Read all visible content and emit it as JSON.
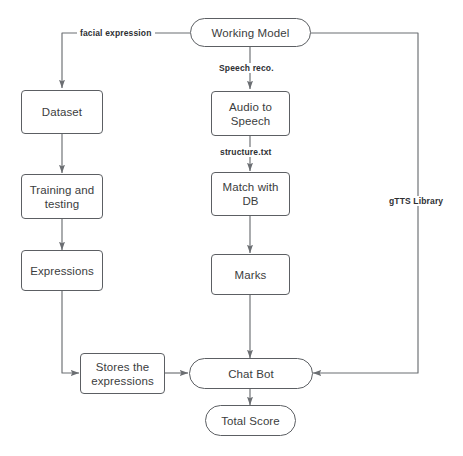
{
  "diagram": {
    "background_color": "#ffffff",
    "stroke_color": "#5c5f63",
    "text_color": "#3b3d40",
    "nodes": [
      {
        "id": "working-model",
        "label": "Working Model",
        "shape": "stadium"
      },
      {
        "id": "dataset",
        "label": "Dataset",
        "shape": "box"
      },
      {
        "id": "training-and-testing",
        "label": "Training and\ntesting",
        "shape": "box"
      },
      {
        "id": "expressions",
        "label": "Expressions",
        "shape": "box"
      },
      {
        "id": "audio-to-speech",
        "label": "Audio to\nSpeech",
        "shape": "box"
      },
      {
        "id": "match-with-db",
        "label": "Match with\nDB",
        "shape": "box"
      },
      {
        "id": "marks",
        "label": "Marks",
        "shape": "box"
      },
      {
        "id": "stores-the-expressions",
        "label": "Stores the\nexpressions",
        "shape": "box"
      },
      {
        "id": "chat-bot",
        "label": "Chat Bot",
        "shape": "stadium"
      },
      {
        "id": "total-score",
        "label": "Total Score",
        "shape": "stadium"
      }
    ],
    "edge_labels": [
      {
        "id": "facial-expression",
        "label": "facial expression"
      },
      {
        "id": "speech-reco",
        "label": "Speech reco."
      },
      {
        "id": "structure-txt",
        "label": "structure.txt"
      },
      {
        "id": "gtts-library",
        "label": "gTTS Library"
      }
    ],
    "edges": [
      {
        "from": "working-model",
        "to": "dataset",
        "label": "facial expression"
      },
      {
        "from": "working-model",
        "to": "audio-to-speech",
        "label": "Speech reco."
      },
      {
        "from": "working-model",
        "to": "chat-bot",
        "label": "gTTS Library"
      },
      {
        "from": "dataset",
        "to": "training-and-testing",
        "label": ""
      },
      {
        "from": "training-and-testing",
        "to": "expressions",
        "label": ""
      },
      {
        "from": "expressions",
        "to": "stores-the-expressions",
        "label": ""
      },
      {
        "from": "audio-to-speech",
        "to": "match-with-db",
        "label": "structure.txt"
      },
      {
        "from": "match-with-db",
        "to": "marks",
        "label": ""
      },
      {
        "from": "marks",
        "to": "chat-bot",
        "label": ""
      },
      {
        "from": "stores-the-expressions",
        "to": "chat-bot",
        "label": ""
      },
      {
        "from": "chat-bot",
        "to": "total-score",
        "label": ""
      }
    ]
  }
}
